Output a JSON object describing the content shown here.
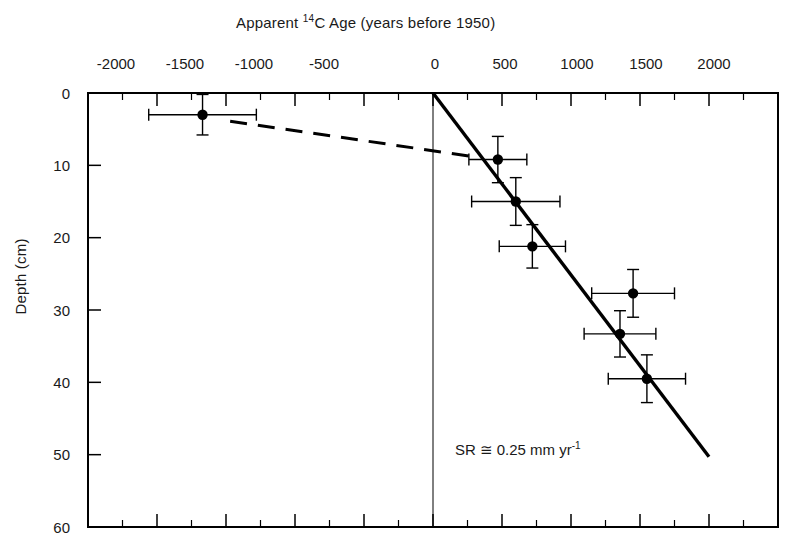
{
  "chart_data": {
    "type": "scatter",
    "title": "Apparent 14C Age (years before 1950)",
    "title_parts": {
      "lead": "Apparent ",
      "sup": "14",
      "tail": "C Age (years before 1950)"
    },
    "xlabel": "Apparent 14C Age (years before 1950)",
    "ylabel": "Depth (cm)",
    "xlim": [
      -2500,
      2500
    ],
    "ylim": [
      60,
      0
    ],
    "y_inverted": true,
    "grid": false,
    "legend": null,
    "xticks": [
      -2000,
      -1500,
      -1000,
      -500,
      0,
      500,
      1000,
      1500,
      2000
    ],
    "xtick_labels": [
      "-2000",
      "-1500",
      "-1000",
      "-500",
      "0",
      "500",
      "1000",
      "1500",
      "2000"
    ],
    "x_minor_ticks": [
      -2250,
      -1750,
      -1250,
      -750,
      -250,
      250,
      750,
      1250,
      1750,
      2250
    ],
    "yticks": [
      0,
      10,
      20,
      30,
      40,
      50,
      60
    ],
    "ytick_labels": [
      "0",
      "10",
      "20",
      "30",
      "40",
      "50",
      "60"
    ],
    "points": [
      {
        "x": -1670,
        "y": 3.0,
        "xerr": 390,
        "yerr": 2.8,
        "series": "radiocarbon-date"
      },
      {
        "x": 470,
        "y": 9.2,
        "xerr": 210,
        "yerr": 3.2,
        "series": "radiocarbon-date"
      },
      {
        "x": 600,
        "y": 15.0,
        "xerr": 320,
        "yerr": 3.3,
        "series": "radiocarbon-date"
      },
      {
        "x": 720,
        "y": 21.2,
        "xerr": 240,
        "yerr": 3.0,
        "series": "radiocarbon-date"
      },
      {
        "x": 1450,
        "y": 27.7,
        "xerr": 300,
        "yerr": 3.3,
        "series": "radiocarbon-date"
      },
      {
        "x": 1355,
        "y": 33.3,
        "xerr": 260,
        "yerr": 3.2,
        "series": "radiocarbon-date"
      },
      {
        "x": 1550,
        "y": 39.5,
        "xerr": 280,
        "yerr": 3.3,
        "series": "radiocarbon-date"
      }
    ],
    "fit_line": {
      "style": "solid",
      "label": "sedimentation-rate-fit",
      "x_start": 0,
      "y_start": 0,
      "x_end": 2000,
      "y_end": 50.3
    },
    "extrapolation_line": {
      "style": "dashed",
      "label": "extrapolation-to-surface-date",
      "x_start": -1470,
      "y_start": 3.9,
      "x_end": 330,
      "y_end": 8.9
    },
    "annotations": [
      {
        "name": "sedimentation-rate",
        "text": "SR ≅ 0.25 mm yr-1",
        "parts": {
          "lead": "SR ≅ 0.25 mm yr",
          "sup": "-1"
        },
        "x": 780,
        "y": 47.5
      }
    ],
    "colors": {
      "axis": "#000000",
      "marker": "#000000",
      "fit_line": "#000000",
      "extrapolation_line": "#000000",
      "errorbar": "#000000",
      "background": "#ffffff"
    }
  }
}
